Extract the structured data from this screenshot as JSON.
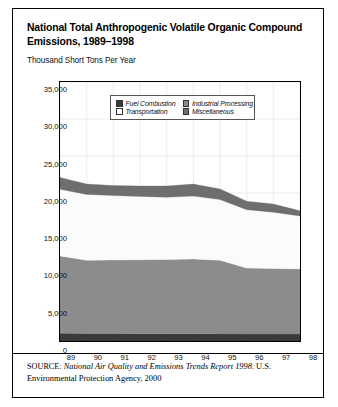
{
  "figure": {
    "title": "National Total Anthropogenic Volatile Organic Compound Emissions, 1989–1998",
    "subtitle": "Thousand Short Tons Per Year",
    "source_label": "SOURCE:",
    "source_italic": "National Air Quality and Emissions Trends Report 1998.",
    "source_rest": " U.S. Environmental Protection Agency, 2000"
  },
  "colors": {
    "fuel_combustion": "#3a3a3a",
    "industrial_processing": "#8c8c8c",
    "transportation": "#fbfbfb",
    "miscellaneous": "#6e6e6e",
    "axis": "#000000",
    "grid": "#d8d8d8"
  },
  "legend": {
    "position": "inside-top-center",
    "items": [
      {
        "label": "Fuel Combustion",
        "swatch": "#3a3a3a"
      },
      {
        "label": "Industrial Processing",
        "swatch": "#8c8c8c"
      },
      {
        "label": "Transportation",
        "swatch": "#fbfbfb"
      },
      {
        "label": "Miscellaneous",
        "swatch": "#6e6e6e"
      }
    ]
  },
  "chart_data": {
    "type": "area",
    "stacked": true,
    "title": "National Total Anthropogenic Volatile Organic Compound Emissions, 1989–1998",
    "subtitle": "Thousand Short Tons Per Year",
    "xlabel": "",
    "ylabel": "Thousand Short Tons Per Year",
    "categories": [
      "89",
      "90",
      "91",
      "92",
      "93",
      "94",
      "95",
      "96",
      "97",
      "98"
    ],
    "x_tick_labels": [
      "89",
      "90",
      "91",
      "92",
      "93",
      "94",
      "95",
      "96",
      "97",
      "98"
    ],
    "y_tick_labels": [
      "0",
      "5,000",
      "10,000",
      "15,000",
      "20,000",
      "25,000",
      "30,000",
      "35,000"
    ],
    "y_ticks": [
      0,
      5000,
      10000,
      15000,
      20000,
      25000,
      30000,
      35000
    ],
    "ylim": [
      0,
      35000
    ],
    "grid": true,
    "legend_position": "inside top center",
    "series": [
      {
        "name": "Fuel Combustion",
        "color": "#3a3a3a",
        "values": [
          1050,
          1000,
          1000,
          980,
          980,
          980,
          960,
          950,
          950,
          940
        ]
      },
      {
        "name": "Industrial Processing",
        "color": "#8c8c8c",
        "values": [
          10450,
          9900,
          9950,
          10000,
          10050,
          10100,
          9950,
          8900,
          8850,
          8800
        ]
      },
      {
        "name": "Transportation",
        "color": "#fbfbfb",
        "values": [
          9000,
          8900,
          8700,
          8550,
          8400,
          8500,
          8200,
          7900,
          7600,
          7150
        ]
      },
      {
        "name": "Miscellaneous",
        "color": "#6e6e6e",
        "values": [
          1600,
          1400,
          1350,
          1420,
          1520,
          1620,
          1440,
          1150,
          1100,
          700
        ]
      }
    ],
    "totals": [
      22100,
      21200,
      21000,
      20950,
      20950,
      21200,
      20550,
      18900,
      18500,
      17590
    ],
    "units": "thousand short tons per year"
  }
}
